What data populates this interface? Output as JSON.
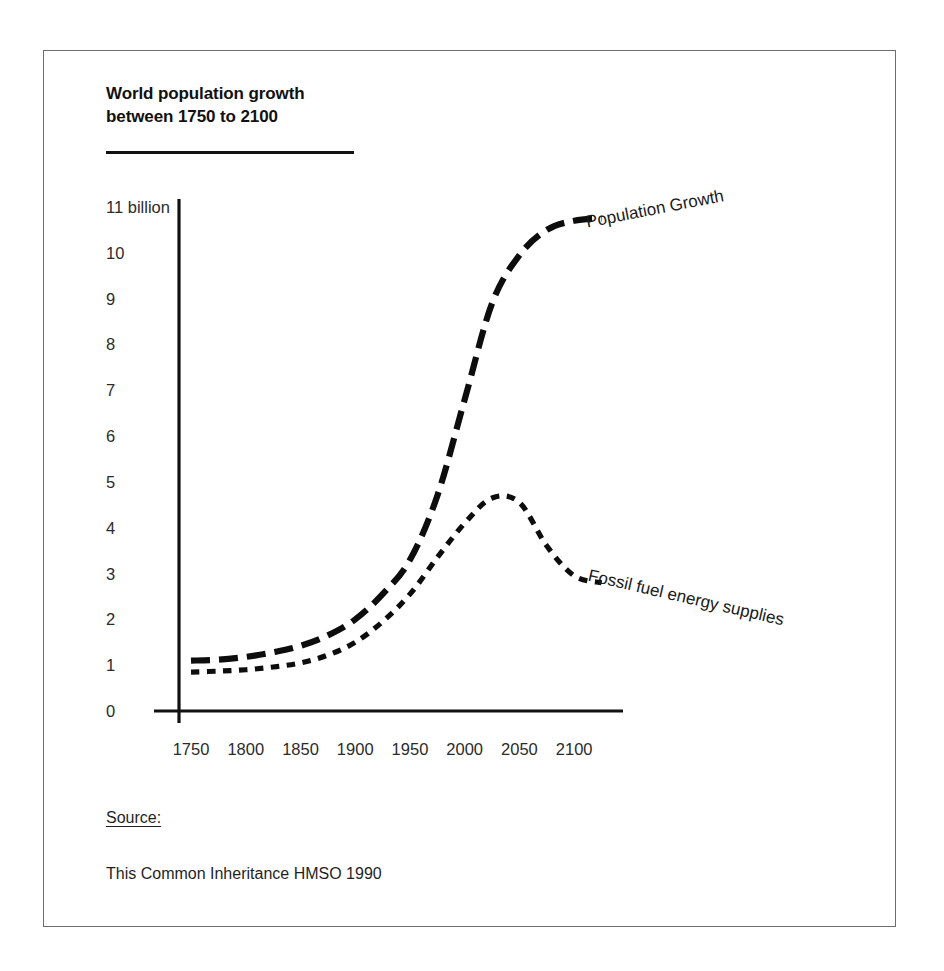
{
  "figure": {
    "title": "World population growth\nbetween 1750 to 2100",
    "source_heading": "Source:",
    "source_text": "This Common Inheritance HMSO 1990"
  },
  "chart_data": {
    "type": "line",
    "title": "World population growth between 1750 to 2100",
    "xlabel": "",
    "ylabel": "billion",
    "xlim": [
      1750,
      2140
    ],
    "ylim": [
      0,
      11
    ],
    "grid": false,
    "legend_position": "inline-at-curve-end",
    "xticks": [
      "1750",
      "1800",
      "1850",
      "1900",
      "1950",
      "2000",
      "2050",
      "2100"
    ],
    "xtick_values": [
      1750,
      1800,
      1850,
      1900,
      1950,
      2000,
      2050,
      2100
    ],
    "yticks": [
      "11 billion",
      "10",
      "9",
      "8",
      "7",
      "6",
      "5",
      "4",
      "3",
      "2",
      "1",
      "0"
    ],
    "ytick_values": [
      11,
      10,
      9,
      8,
      7,
      6,
      5,
      4,
      3,
      2,
      1,
      0
    ],
    "x": [
      1750,
      1775,
      1800,
      1825,
      1850,
      1875,
      1900,
      1925,
      1950,
      1975,
      2000,
      2025,
      2050,
      2075,
      2100,
      2125
    ],
    "series": [
      {
        "name": "Population Growth",
        "label": "Population Growth",
        "style": "long-dashed",
        "color": "#0d0d0d",
        "values": [
          1.1,
          1.12,
          1.18,
          1.28,
          1.42,
          1.65,
          2.0,
          2.55,
          3.3,
          4.7,
          6.8,
          8.9,
          9.95,
          10.5,
          10.7,
          10.75
        ]
      },
      {
        "name": "Fossil fuel energy supplies",
        "label": "Fossil fuel energy supplies",
        "style": "short-dashed",
        "color": "#0d0d0d",
        "values": [
          0.85,
          0.87,
          0.9,
          0.96,
          1.05,
          1.22,
          1.5,
          1.95,
          2.55,
          3.35,
          4.1,
          4.65,
          4.55,
          3.6,
          2.95,
          2.8
        ]
      }
    ],
    "annotations": [
      {
        "text": "Population Growth",
        "x": 2112,
        "y": 10.55,
        "rotation": -11
      },
      {
        "text": "Fossil fuel energy supplies",
        "x": 2112,
        "y": 2.85,
        "rotation": 13
      }
    ]
  }
}
